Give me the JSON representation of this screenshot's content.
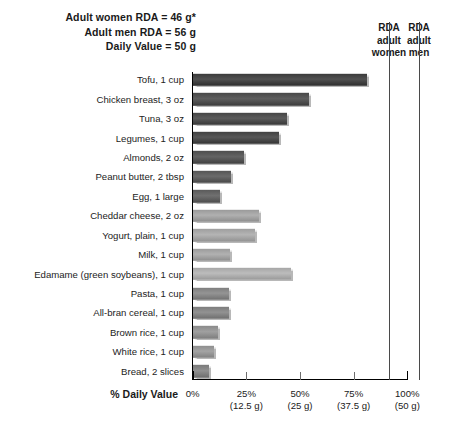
{
  "header": {
    "notes": [
      "Adult women RDA = 46 g*",
      "Adult men RDA = 56 g",
      "Daily Value = 50 g"
    ],
    "rda_women_head": "RDA\nadult\nwomen",
    "rda_women_lines": [
      "RDA",
      "adult",
      "women"
    ],
    "rda_men_lines": [
      "RDA",
      "adult",
      "men"
    ]
  },
  "chart_data": {
    "type": "bar",
    "orientation": "horizontal",
    "title": "",
    "xlabel": "% Daily Value",
    "ylabel": "",
    "xlim": [
      0,
      100
    ],
    "grid": false,
    "legend": "none",
    "categories": [
      "Tofu, 1 cup",
      "Chicken breast, 3 oz",
      "Tuna, 3 oz",
      "Legumes, 1 cup",
      "Almonds, 2 oz",
      "Peanut butter, 2 tbsp",
      "Egg, 1 large",
      "Cheddar cheese, 2 oz",
      "Yogurt, plain, 1 cup",
      "Milk, 1 cup",
      "Edamame (green soybeans), 1 cup",
      "Pasta, 1 cup",
      "All-bran cereal, 1 cup",
      "Brown rice, 1 cup",
      "White rice, 1 cup",
      "Bread, 2 slices"
    ],
    "values": [
      81,
      54,
      44,
      40,
      24,
      18,
      12.5,
      31,
      29,
      17.5,
      46,
      17,
      17,
      12,
      10,
      7.5
    ],
    "bar_colors": [
      "#3b3b3b",
      "#484848",
      "#454545",
      "#414141",
      "#4d4d4d",
      "#555555",
      "#5a5a5a",
      "#9a9a9a",
      "#9e9e9e",
      "#9b9b9b",
      "#a6a6a6",
      "#7e7e7e",
      "#7c7c7c",
      "#8a8a8a",
      "#8e8e8e",
      "#7a7a7a"
    ],
    "xticks": [
      {
        "pct": "0%",
        "grams": "",
        "value": 0
      },
      {
        "pct": "25%",
        "grams": "(12.5 g)",
        "value": 25
      },
      {
        "pct": "50%",
        "grams": "(25 g)",
        "value": 50
      },
      {
        "pct": "75%",
        "grams": "(37.5 g)",
        "value": 75
      },
      {
        "pct": "100%",
        "grams": "(50 g)",
        "value": 100
      }
    ],
    "reference_lines": [
      {
        "name": "RDA adult women",
        "value": 92,
        "px": 389
      },
      {
        "name": "RDA adult men",
        "value": 112,
        "px": 419
      }
    ]
  }
}
